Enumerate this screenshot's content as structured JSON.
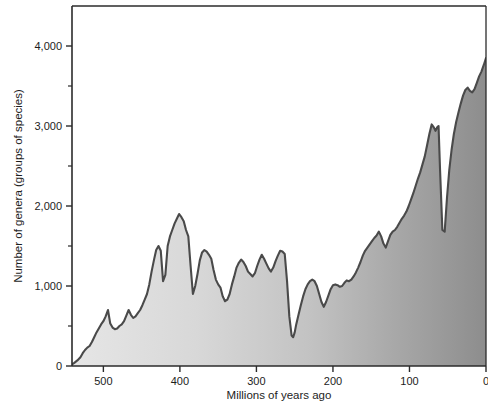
{
  "chart_data": {
    "type": "area",
    "title": "",
    "subtitle": "",
    "xlabel": "Millions of years ago",
    "ylabel": "Number of genera (groups of species)",
    "xlim": [
      541,
      0
    ],
    "ylim": [
      0,
      4500
    ],
    "x_reversed": true,
    "grid": false,
    "legend": null,
    "x_ticks_major": [
      500,
      400,
      300,
      200,
      100,
      0
    ],
    "x_tick_labels": [
      "500",
      "400",
      "300",
      "200",
      "100",
      "0"
    ],
    "y_ticks_major": [
      0,
      1000,
      2000,
      3000,
      4000
    ],
    "y_tick_labels": [
      "0",
      "1,000",
      "2,000",
      "3,000",
      "4,000"
    ],
    "y_ticks_minor": [
      500,
      1500,
      2500,
      3500
    ],
    "series_name": "Number of marine genera",
    "line_color": "#4a4a4a",
    "fill_gradient_start": "#e6e6e6",
    "fill_gradient_end": "#8d8d8d",
    "axis_color": "#2b2b2b",
    "x": [
      541,
      538,
      534,
      530,
      527,
      524,
      521,
      518,
      515,
      512,
      509,
      506,
      503,
      500,
      497,
      494,
      491,
      488,
      485,
      482,
      479,
      476,
      473,
      470,
      467,
      464,
      461,
      458,
      455,
      452,
      449,
      446,
      443,
      440,
      437,
      434,
      431,
      428,
      425,
      422,
      419,
      416,
      413,
      410,
      407,
      404,
      401,
      398,
      395,
      392,
      389,
      386,
      383,
      380,
      377,
      374,
      371,
      368,
      365,
      362,
      359,
      356,
      353,
      350,
      347,
      344,
      341,
      338,
      335,
      332,
      329,
      326,
      323,
      320,
      317,
      314,
      311,
      308,
      305,
      302,
      299,
      296,
      293,
      290,
      287,
      284,
      281,
      278,
      275,
      272,
      269,
      266,
      263,
      260,
      257,
      254,
      252,
      250,
      248,
      245,
      242,
      239,
      236,
      233,
      230,
      227,
      224,
      221,
      218,
      215,
      212,
      209,
      206,
      203,
      200,
      197,
      194,
      191,
      188,
      185,
      182,
      179,
      176,
      173,
      170,
      167,
      164,
      161,
      158,
      155,
      152,
      149,
      146,
      143,
      140,
      137,
      134,
      131,
      128,
      125,
      122,
      119,
      116,
      113,
      110,
      107,
      104,
      101,
      98,
      95,
      92,
      89,
      86,
      83,
      80,
      77,
      74,
      71,
      68,
      66,
      65,
      64,
      62,
      60,
      57,
      54,
      51,
      48,
      45,
      42,
      39,
      36,
      33,
      30,
      27,
      24,
      21,
      18,
      15,
      12,
      9,
      6,
      3,
      0
    ],
    "y": [
      20,
      40,
      70,
      110,
      160,
      200,
      230,
      250,
      300,
      360,
      420,
      470,
      520,
      560,
      620,
      700,
      530,
      480,
      460,
      470,
      500,
      520,
      560,
      630,
      700,
      640,
      600,
      620,
      660,
      700,
      760,
      830,
      900,
      1020,
      1180,
      1320,
      1450,
      1500,
      1440,
      1060,
      1140,
      1500,
      1620,
      1700,
      1780,
      1840,
      1900,
      1860,
      1810,
      1700,
      1620,
      1250,
      900,
      1000,
      1150,
      1320,
      1420,
      1450,
      1430,
      1390,
      1340,
      1200,
      1080,
      1020,
      980,
      870,
      810,
      830,
      900,
      1020,
      1120,
      1230,
      1290,
      1330,
      1300,
      1250,
      1180,
      1150,
      1120,
      1160,
      1250,
      1330,
      1390,
      1340,
      1280,
      1220,
      1180,
      1230,
      1310,
      1380,
      1440,
      1430,
      1400,
      1060,
      620,
      380,
      360,
      420,
      520,
      640,
      760,
      870,
      960,
      1020,
      1060,
      1080,
      1060,
      1000,
      900,
      800,
      740,
      800,
      880,
      960,
      1010,
      1020,
      1010,
      990,
      1000,
      1040,
      1070,
      1060,
      1080,
      1120,
      1170,
      1230,
      1300,
      1380,
      1440,
      1480,
      1520,
      1560,
      1600,
      1630,
      1680,
      1620,
      1530,
      1480,
      1560,
      1640,
      1680,
      1700,
      1740,
      1790,
      1840,
      1880,
      1930,
      2000,
      2080,
      2160,
      2250,
      2340,
      2420,
      2520,
      2620,
      2760,
      2900,
      3020,
      2980,
      2940,
      2960,
      2980,
      3000,
      2440,
      1700,
      1680,
      2100,
      2450,
      2700,
      2900,
      3050,
      3170,
      3280,
      3380,
      3450,
      3480,
      3440,
      3420,
      3460,
      3540,
      3620,
      3680,
      3760,
      3850,
      3980,
      4120,
      4250,
      4380,
      4480
    ],
    "annotations": [
      {
        "label": "end-Permian low",
        "x": 250,
        "y": 360
      },
      {
        "label": "end-Cretaceous low",
        "x": 65,
        "y": 1680
      },
      {
        "label": "modern peak",
        "x": 0,
        "y": 4480
      }
    ]
  }
}
